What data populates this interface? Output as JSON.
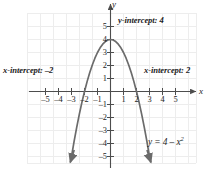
{
  "figure": {
    "axis_label_x": "x",
    "axis_label_y": "y",
    "annotations": {
      "y_intercept": "y-intercept: 4",
      "x_intercept_left": "x-intercept: –2",
      "x_intercept_right": "x-intercept: 2",
      "equation_lhs": "y = 4 – x",
      "equation_exponent": "2"
    },
    "colors": {
      "curve": "#6b6b6b",
      "axis": "#4d4d4d",
      "grid": "#ededed",
      "text": "#1d1d1d",
      "background": "#ffffff"
    }
  },
  "chart_data": {
    "type": "line",
    "title": "",
    "subtitle": "",
    "xlabel": "x",
    "ylabel": "y",
    "equation": "y = 4 - x^2",
    "xlim": [
      -5.8,
      5.8
    ],
    "ylim": [
      -5.8,
      5.8
    ],
    "grid": true,
    "grid_step": 1,
    "legend": "none",
    "xticks": [
      -5,
      -4,
      -3,
      -2,
      -1,
      1,
      2,
      3,
      4,
      5
    ],
    "yticks": [
      -5,
      -4,
      -3,
      -2,
      -1,
      1,
      2,
      3,
      4,
      5
    ],
    "xtick_labels": [
      "–5",
      "–4",
      "–3",
      "–2",
      "–1",
      "1",
      "2",
      "3",
      "4",
      "5"
    ],
    "ytick_labels": [
      "–5",
      "–4",
      "–3",
      "–2",
      "–1",
      "1",
      "2",
      "3",
      "4",
      "5"
    ],
    "series": [
      {
        "name": "y = 4 - x^2",
        "x": [
          -3.05,
          -2.8,
          -2.6,
          -2.4,
          -2.2,
          -2.0,
          -1.8,
          -1.6,
          -1.4,
          -1.2,
          -1.0,
          -0.8,
          -0.6,
          -0.4,
          -0.2,
          0.0,
          0.2,
          0.4,
          0.6,
          0.8,
          1.0,
          1.2,
          1.4,
          1.6,
          1.8,
          2.0,
          2.2,
          2.4,
          2.6,
          2.8,
          3.05
        ],
        "y": [
          -5.3,
          -3.84,
          -2.76,
          -1.76,
          -0.84,
          0.0,
          0.76,
          1.44,
          2.04,
          2.56,
          3.0,
          3.36,
          3.64,
          3.84,
          3.96,
          4.0,
          3.96,
          3.84,
          3.64,
          3.36,
          3.0,
          2.56,
          2.04,
          1.44,
          0.76,
          0.0,
          -0.84,
          -1.76,
          -2.76,
          -3.84,
          -5.3
        ]
      }
    ],
    "key_points": {
      "vertex": [
        0,
        4
      ],
      "y_intercept": [
        0,
        4
      ],
      "x_intercepts": [
        [
          -2,
          0
        ],
        [
          2,
          0
        ]
      ]
    },
    "annotations": [
      {
        "text": "y-intercept: 4",
        "x": 1.0,
        "y": 4.9
      },
      {
        "text": "x-intercept: –2",
        "x": -4.9,
        "y": 1.2
      },
      {
        "text": "x-intercept: 2",
        "x": 3.0,
        "y": 1.2
      },
      {
        "text": "y = 4 – x²",
        "x": 3.5,
        "y": -4.0
      }
    ]
  }
}
